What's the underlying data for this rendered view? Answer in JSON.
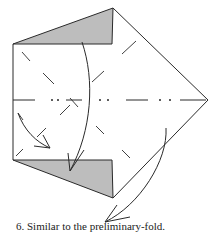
{
  "diagram": {
    "step_number": "6.",
    "caption": "Similar to the preliminary-fold.",
    "caption_full": "6. Similar to the preliminary-fold.",
    "colors": {
      "line": "#2a2a2a",
      "shade": "#bdbdbd",
      "background": "#ffffff"
    },
    "elements": [
      "outline-pentagon",
      "shaded-top-triangle",
      "shaded-bottom-triangle",
      "horizontal-mountain-fold-line",
      "valley-fold-dashes",
      "curved-arrow-top-to-bottom",
      "curved-arrow-left-inner",
      "curved-arrow-right-to-bottom"
    ]
  }
}
